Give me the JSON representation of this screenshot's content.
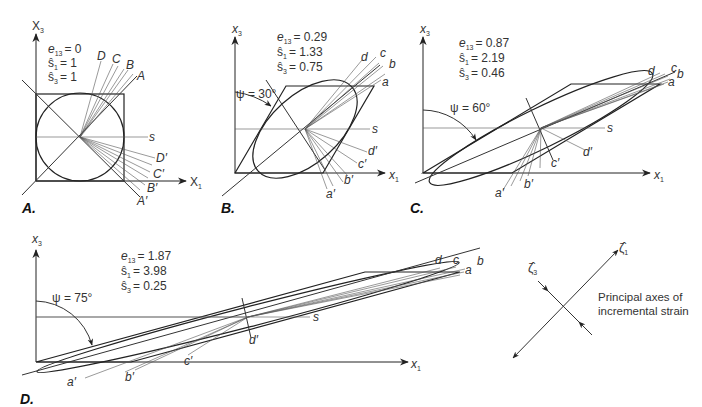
{
  "figure": {
    "panels": [
      {
        "id": "A",
        "label": "A.",
        "axis_x": "X",
        "axis_x_sub": "1",
        "axis_z": "X",
        "axis_z_sub": "3",
        "params": [
          {
            "name": "e",
            "sub": "13",
            "value": "= 0"
          },
          {
            "name": "ŝ",
            "sub": "1",
            "value": "= 1"
          },
          {
            "name": "ŝ",
            "sub": "3",
            "value": "= 1"
          }
        ],
        "line_labels_upper": [
          "D",
          "C",
          "B",
          "A"
        ],
        "line_labels_lower": [
          "D′",
          "C′",
          "B′",
          "A′"
        ],
        "s_label": "s"
      },
      {
        "id": "B",
        "label": "B.",
        "axis_x": "x",
        "axis_x_sub": "1",
        "axis_z": "x",
        "axis_z_sub": "3",
        "psi": "ψ = 30°",
        "params": [
          {
            "name": "e",
            "sub": "13",
            "value": "= 0.29"
          },
          {
            "name": "ŝ",
            "sub": "1",
            "value": "= 1.33"
          },
          {
            "name": "ŝ",
            "sub": "3",
            "value": "= 0.75"
          }
        ],
        "line_labels_upper": [
          "d",
          "c",
          "b",
          "a"
        ],
        "line_labels_lower": [
          "d′",
          "c′",
          "b′",
          "a′"
        ],
        "s_label": "s"
      },
      {
        "id": "C",
        "label": "C.",
        "axis_x": "x",
        "axis_x_sub": "1",
        "axis_z": "x",
        "axis_z_sub": "3",
        "psi": "ψ = 60°",
        "params": [
          {
            "name": "e",
            "sub": "13",
            "value": "= 0.87"
          },
          {
            "name": "ŝ",
            "sub": "1",
            "value": "= 2.19"
          },
          {
            "name": "ŝ",
            "sub": "3",
            "value": "= 0.46"
          }
        ],
        "line_labels_upper": [
          "d",
          "c",
          "b",
          "a"
        ],
        "line_labels_lower": [
          "d′",
          "c′",
          "b′",
          "a′"
        ],
        "s_label": "s"
      },
      {
        "id": "D",
        "label": "D.",
        "axis_x": "x",
        "axis_x_sub": "1",
        "axis_z": "x",
        "axis_z_sub": "3",
        "psi": "ψ = 75°",
        "params": [
          {
            "name": "e",
            "sub": "13",
            "value": "= 1.87"
          },
          {
            "name": "ŝ",
            "sub": "1",
            "value": "= 3.98"
          },
          {
            "name": "ŝ",
            "sub": "3",
            "value": "= 0.25"
          }
        ],
        "line_labels_upper": [
          "d",
          "c",
          "b",
          "a"
        ],
        "line_labels_lower": [
          "d′",
          "c′",
          "b′",
          "a′"
        ],
        "s_label": "s"
      }
    ],
    "legend": {
      "axis1": "ζ̂",
      "axis1_sub": "1",
      "axis3": "ζ̂",
      "axis3_sub": "3",
      "caption_line1": "Principal axes of",
      "caption_line2": "incremental strain"
    }
  }
}
